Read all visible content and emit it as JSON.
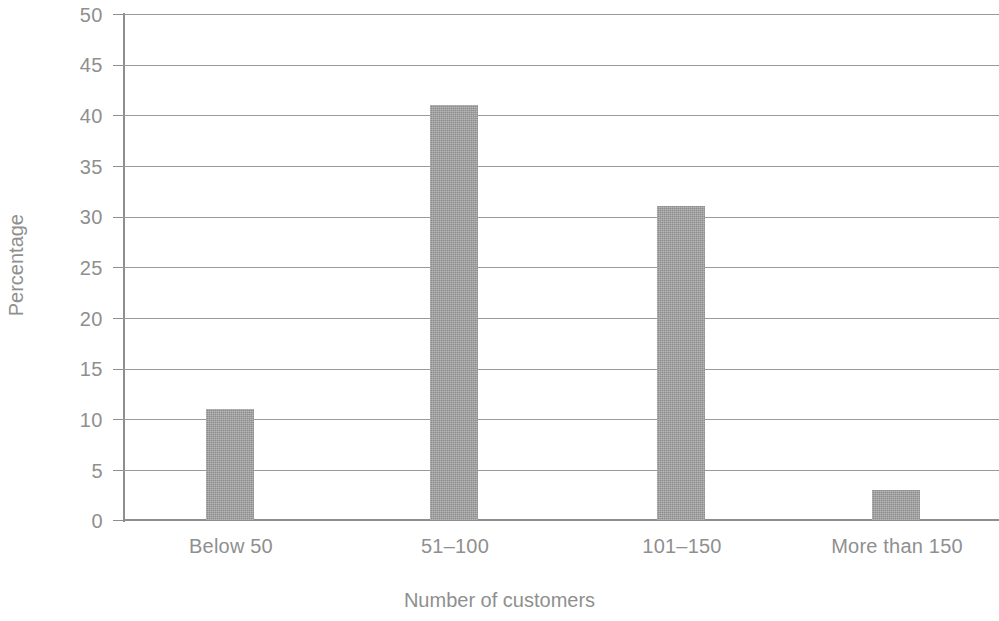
{
  "chart_data": {
    "type": "bar",
    "title": "",
    "xlabel": "Number of customers",
    "ylabel": "Percentage",
    "categories": [
      "Below 50",
      "51–100",
      "101–150",
      "More than 150"
    ],
    "values": [
      11,
      41,
      31,
      3
    ],
    "ylim": [
      0,
      50
    ],
    "yticks": [
      0,
      5,
      10,
      15,
      20,
      25,
      30,
      35,
      40,
      45,
      50
    ],
    "ytick_labels": [
      "0",
      "5",
      "10",
      "15",
      "20",
      "25",
      "30",
      "35",
      "40",
      "45",
      "50"
    ],
    "grid": true,
    "legend": false,
    "series": [
      {
        "name": "Percentage",
        "values": [
          11,
          41,
          31,
          3
        ],
        "color": "#9e9e9e"
      }
    ],
    "colors": {
      "bar_fill": "#9e9e9e",
      "gridline": "#9a9a9a",
      "axis": "#8e8e8e",
      "text": "#8f8f8f",
      "background": "#ffffff"
    }
  }
}
